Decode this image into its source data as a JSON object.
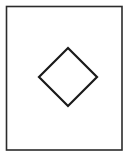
{
  "document": {
    "title": "Diamond inside rectangle figure",
    "width": 130,
    "height": 157,
    "background_color": "#ffffff"
  },
  "colors": {
    "page_background": "#ffffff",
    "frame_stroke": "#2b2b2b",
    "frame_fill": "#ffffff",
    "diamond_stroke": "#1a1a1a",
    "diamond_fill": "#ffffff"
  },
  "figure": {
    "name": "rotated-square-in-frame",
    "frame": {
      "name": "outer-rectangle",
      "x": 6.5,
      "y": 6.5,
      "width": 115.5,
      "height": 143.5,
      "stroke_width": 1.6,
      "stroke": "#2b2b2b",
      "fill": "#ffffff"
    },
    "diamond": {
      "name": "diamond",
      "center_x": 68,
      "center_y": 77,
      "half_width": 29,
      "half_height": 29,
      "stroke_width": 2.2,
      "stroke": "#1a1a1a",
      "fill": "#ffffff",
      "points": "68,48 97,77 68,106 39,77",
      "vertices": [
        {
          "label": "top",
          "x": 68,
          "y": 48
        },
        {
          "label": "right",
          "x": 97,
          "y": 77
        },
        {
          "label": "bottom",
          "x": 68,
          "y": 106
        },
        {
          "label": "left",
          "x": 39,
          "y": 77
        }
      ]
    }
  }
}
